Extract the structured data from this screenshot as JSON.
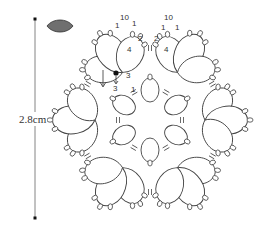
{
  "diagram": {
    "type": "tatting-pattern",
    "motif": "hexagonal snowflake doily motif",
    "measurement": {
      "label": "2.8cm",
      "orientation": "vertical"
    },
    "shuttle_icon": {
      "name": "shuttle-leaf-icon",
      "fill": "#6f6f6f",
      "stroke": "#333333"
    },
    "line_color": "#444444",
    "start_marker": {
      "color": "#111111",
      "labels": [
        "3",
        "3",
        "1"
      ]
    },
    "stitch_labels_top_left_clover": [
      "1",
      "10",
      "1",
      "1",
      "2",
      "4"
    ],
    "stitch_labels_top_right_clover": [
      "1",
      "10",
      "1",
      "1",
      "2",
      "4"
    ],
    "units": {
      "outer_clovers": 6,
      "petals_per_clover": 3,
      "inner_rings": 6
    }
  }
}
